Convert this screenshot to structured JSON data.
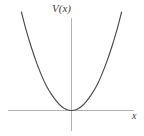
{
  "figure": {
    "background_color": "#ffffff",
    "width": 144,
    "height": 136,
    "axis_color": "#b4b4b4",
    "curve_color": "#4a4a4a",
    "label_color": "#3d3d3d"
  },
  "chart_data": {
    "type": "line",
    "title": "",
    "subtitle": "",
    "xlabel": "x",
    "ylabel": "V(x)",
    "legend": [],
    "legend_position": "none",
    "grid": false,
    "tick_labels_x": [],
    "tick_labels_y": [],
    "xlim": [
      -1.26,
      1.26
    ],
    "ylim": [
      -0.22,
      1.62
    ],
    "origin_pixel": [
      71,
      110
    ],
    "series": [
      {
        "name": "V(x)",
        "equation": "V(x) = x^2",
        "x": [
          -1.01,
          -0.91,
          -0.81,
          -0.71,
          -0.61,
          -0.51,
          -0.4,
          -0.3,
          -0.2,
          -0.1,
          0.0,
          0.1,
          0.2,
          0.3,
          0.4,
          0.51,
          0.61,
          0.71,
          0.81,
          0.91,
          1.01
        ],
        "values": [
          1.62,
          1.31,
          1.04,
          0.8,
          0.59,
          0.41,
          0.26,
          0.15,
          0.065,
          0.016,
          0.0,
          0.016,
          0.065,
          0.15,
          0.26,
          0.41,
          0.59,
          0.8,
          1.04,
          1.31,
          1.62
        ]
      }
    ]
  },
  "axes": {
    "y_axis": {
      "name": "vertical-axis",
      "x_pixel": 71,
      "y_top": 18,
      "y_bottom": 131
    },
    "x_axis": {
      "name": "horizontal-axis",
      "y_pixel": 110,
      "x_left": 8,
      "x_right": 134
    }
  }
}
